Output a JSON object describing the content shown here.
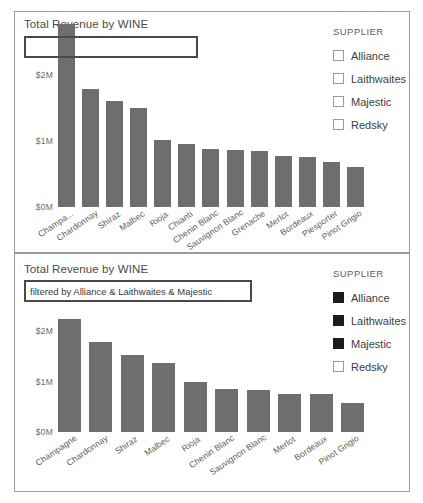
{
  "charts": [
    {
      "title": "Total Revenue by WINE",
      "filter_text": "",
      "legend_title": "SUPPLIER",
      "legend_items": [
        {
          "label": "Alliance",
          "selected": false
        },
        {
          "label": "Laithwaites",
          "selected": false
        },
        {
          "label": "Majestic",
          "selected": false
        },
        {
          "label": "Redsky",
          "selected": false
        }
      ]
    },
    {
      "title": "Total Revenue by WINE",
      "filter_text": "filtered by Alliance & Laithwaites & Majestic",
      "legend_title": "SUPPLIER",
      "legend_items": [
        {
          "label": "Alliance",
          "selected": true
        },
        {
          "label": "Laithwaites",
          "selected": true
        },
        {
          "label": "Majestic",
          "selected": true
        },
        {
          "label": "Redsky",
          "selected": false
        }
      ]
    }
  ],
  "chart_data": [
    {
      "type": "bar",
      "title": "Total Revenue by WINE",
      "xlabel": "WINE",
      "ylabel": "Total Revenue",
      "ylim": [
        0,
        2.5
      ],
      "yticks": [
        "$0M",
        "$1M",
        "$2M"
      ],
      "ytick_values": [
        0,
        1,
        2
      ],
      "grid": false,
      "legend_position": "right",
      "bar_color": "#6e6e6e",
      "categories": [
        "Champa...",
        "Chardonnay",
        "Shiraz",
        "Malbec",
        "Rioja",
        "Chianti",
        "Chenin Blanc",
        "Sauvignon Blanc",
        "Grenache",
        "Merlot",
        "Bordeaux",
        "Piesporter",
        "Pinot Grigio"
      ],
      "values": [
        2.35,
        1.79,
        1.61,
        1.5,
        1.02,
        0.95,
        0.88,
        0.87,
        0.85,
        0.78,
        0.76,
        0.68,
        0.61
      ],
      "note": "First bar is clipped behind the title filter box"
    },
    {
      "type": "bar",
      "title": "Total Revenue by WINE",
      "subtitle": "filtered by Alliance & Laithwaites & Majestic",
      "xlabel": "WINE",
      "ylabel": "Total Revenue",
      "ylim": [
        0,
        2.5
      ],
      "yticks": [
        "$0M",
        "$1M",
        "$2M"
      ],
      "ytick_values": [
        0,
        1,
        2
      ],
      "grid": false,
      "legend_position": "right",
      "bar_color": "#6e6e6e",
      "categories": [
        "Champagne",
        "Chardonnay",
        "Shiraz",
        "Malbec",
        "Rioja",
        "Chenin Blanc",
        "Sauvignon Blanc",
        "Merlot",
        "Bordeaux",
        "Pinot Grigio"
      ],
      "values": [
        2.25,
        1.78,
        1.53,
        1.37,
        0.99,
        0.85,
        0.84,
        0.76,
        0.75,
        0.57
      ]
    }
  ]
}
